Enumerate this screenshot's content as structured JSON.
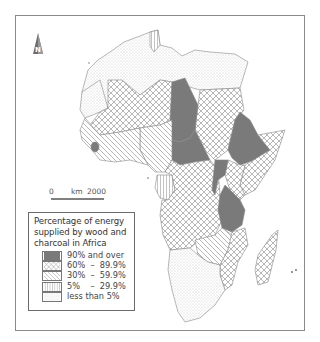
{
  "map": {
    "title": "Percentage of energy supplied by wood and charcoal in Africa",
    "north_arrow_label": "N",
    "scale": {
      "start": "0",
      "unit": "km",
      "end": "2000"
    },
    "colors": {
      "frame": "#8a8a8a",
      "border": "#888888",
      "solid_fill": "#7a7a7a",
      "pattern_line": "#9a9a9a"
    }
  },
  "legend": {
    "title_lines": [
      "Percentage of energy",
      "supplied by wood and",
      "charcoal in Africa"
    ],
    "items": [
      {
        "label": "90% and over",
        "pattern": "solid"
      },
      {
        "label": "60%  –  89.9%",
        "pattern": "crosshatch"
      },
      {
        "label": "30%  –  59.9%",
        "pattern": "diagonal"
      },
      {
        "label": "5%    –  29.9%",
        "pattern": "vertical"
      },
      {
        "label": "less than 5%",
        "pattern": "dots"
      }
    ]
  },
  "regions": [
    {
      "name": "North Africa (Morocco, Algeria, Libya, Egypt, W. Sahara)",
      "category": "less than 5%"
    },
    {
      "name": "Tunisia",
      "category": "5% – 29.9%"
    },
    {
      "name": "Chad",
      "category": "90% and over"
    },
    {
      "name": "Central African Republic",
      "category": "90% and over"
    },
    {
      "name": "Ethiopia",
      "category": "90% and over"
    },
    {
      "name": "Uganda / Rwanda / Burundi",
      "category": "90% and over"
    },
    {
      "name": "Tanzania",
      "category": "90% and over"
    },
    {
      "name": "Sierra Leone",
      "category": "90% and over"
    },
    {
      "name": "Mali / Niger / Mauritania-south",
      "category": "60% – 89.9%"
    },
    {
      "name": "Sudan",
      "category": "60% – 89.9%"
    },
    {
      "name": "Somalia / Kenya",
      "category": "60% – 89.9%"
    },
    {
      "name": "Congo basin / Angola",
      "category": "60% – 89.9%"
    },
    {
      "name": "Mozambique",
      "category": "60% – 89.9%"
    },
    {
      "name": "Madagascar",
      "category": "60% – 89.9%"
    },
    {
      "name": "Nigeria",
      "category": "30% – 59.9%"
    },
    {
      "name": "Senegal / Guinea coast",
      "category": "30% – 59.9%"
    },
    {
      "name": "Zambia / Zimbabwe",
      "category": "30% – 59.9%"
    },
    {
      "name": "Gabon",
      "category": "5% – 29.9%"
    },
    {
      "name": "Southern Africa (Namibia, Botswana, South Africa)",
      "category": "less than 5%"
    }
  ]
}
